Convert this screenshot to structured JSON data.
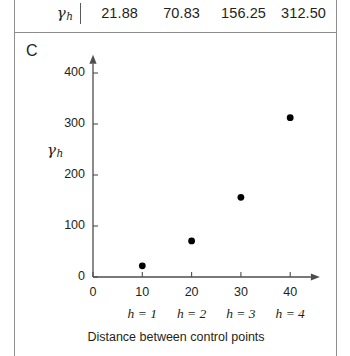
{
  "figure": {
    "panel_label": "C",
    "table_row": {
      "label": "γ",
      "label_sub": "h",
      "values": [
        "21.88",
        "70.83",
        "156.25",
        "312.50"
      ]
    }
  },
  "chart_data": {
    "type": "scatter",
    "title": "",
    "xlabel": "Distance between control points",
    "ylabel": "γh",
    "ylabel_base": "γ",
    "ylabel_sub": "h",
    "x": [
      10,
      20,
      30,
      40
    ],
    "values": [
      21.88,
      70.83,
      156.25,
      312.5
    ],
    "series": [
      {
        "name": "γh",
        "x": [
          10,
          20,
          30,
          40
        ],
        "values": [
          21.88,
          70.83,
          156.25,
          312.5
        ]
      }
    ],
    "xlim": [
      0,
      45
    ],
    "ylim": [
      0,
      430
    ],
    "xticks": [
      "0",
      "10",
      "20",
      "30",
      "40"
    ],
    "xtick_values": [
      0,
      10,
      20,
      30,
      40
    ],
    "yticks": [
      "0",
      "100",
      "200",
      "300",
      "400"
    ],
    "ytick_values": [
      0,
      100,
      200,
      300,
      400
    ],
    "secondary_xticks": [
      "h = 1",
      "h = 2",
      "h = 3",
      "h = 4"
    ],
    "grid": false,
    "legend": "none",
    "marker_color": "#000000",
    "axis_color": "#4d4d4d"
  }
}
